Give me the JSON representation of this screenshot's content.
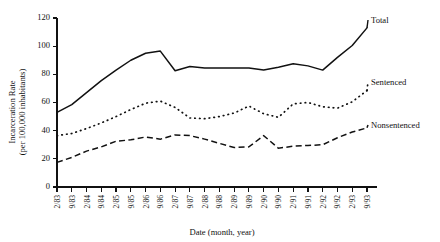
{
  "chart_data": {
    "type": "line",
    "title": "",
    "xlabel": "Date (month, year)",
    "ylabel": "Incarceration Rate\n(per 100,000 inhabitants)",
    "ylabel_line1": "Incarceration Rate",
    "ylabel_line2": "(per 100,000 inhabitants)",
    "ylim": [
      0,
      120
    ],
    "yticks": [
      0,
      20,
      40,
      60,
      80,
      100,
      120
    ],
    "ytick_labels": [
      "0",
      "20",
      "40",
      "60",
      "80",
      "100",
      "120"
    ],
    "grid": false,
    "legend_position": "right-inline-labels",
    "categories": [
      "2/83",
      "9/83",
      "2/84",
      "9/84",
      "2/85",
      "9/85",
      "2/86",
      "9/86",
      "2/87",
      "9/87",
      "2/88",
      "9/88",
      "2/89",
      "9/89",
      "2/90",
      "9/90",
      "2/91",
      "9/91",
      "2/92",
      "9/92",
      "2/93",
      "9/93"
    ],
    "series": [
      {
        "name": "Total",
        "style": "solid",
        "values": [
          53,
          58.5,
          67,
          75.5,
          83,
          90,
          95,
          96.5,
          82.5,
          85.5,
          84.5,
          84.5,
          84.5,
          84.5,
          83,
          85,
          87.5,
          86,
          83,
          92,
          100.5,
          113
        ]
      },
      {
        "name": "Sentenced",
        "style": "dotted",
        "values": [
          36.5,
          38,
          41.5,
          45.5,
          50,
          55,
          59.5,
          61,
          56.5,
          49,
          48.5,
          50,
          52.5,
          57.5,
          52,
          49.5,
          59,
          60,
          57,
          56,
          60.5,
          68.5
        ]
      },
      {
        "name": "Nonsentenced",
        "style": "dashed",
        "values": [
          17.5,
          21,
          25.5,
          28.5,
          32.5,
          33.5,
          35.5,
          34,
          37,
          36.5,
          34,
          31,
          28,
          28.5,
          36.5,
          27.5,
          29,
          29.5,
          30,
          35,
          39,
          42
        ]
      }
    ]
  },
  "labels": {
    "total": "Total",
    "sentenced": "Sentenced",
    "nonsentenced": "Nonsentenced"
  }
}
